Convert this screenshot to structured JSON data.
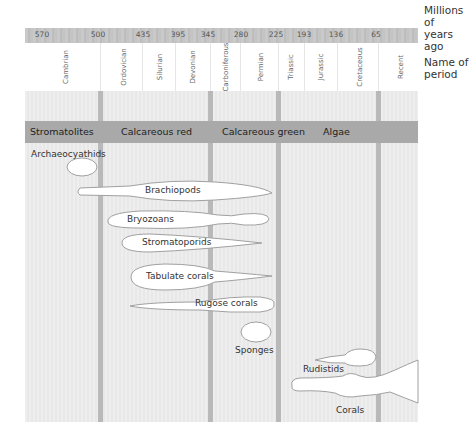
{
  "legend": {
    "time_label": "Millions of years ago",
    "period_label": "Name of period"
  },
  "time_ticks": [
    "570",
    "500",
    "435",
    "395",
    "345",
    "280",
    "225",
    "193",
    "136",
    "65"
  ],
  "periods": [
    "Cambrian",
    "Ordovician",
    "Silurian",
    "Devonian",
    "Carboniferous",
    "Permian",
    "Triassic",
    "Jurassic",
    "Cretaceous",
    "Recent"
  ],
  "reef_builder_groups": [
    "Stromatolites",
    "Calcareous red",
    "Calcareous green",
    "Algae"
  ],
  "taxa": [
    {
      "name": "Archaeocyathids",
      "shape": "oval-cambrian"
    },
    {
      "name": "Brachiopods",
      "shape": "spindle-cambrian-to-permian"
    },
    {
      "name": "Bryozoans",
      "shape": "ordovician-to-permian"
    },
    {
      "name": "Stromatoporids",
      "shape": "ordovician-to-permian"
    },
    {
      "name": "Tabulate corals",
      "shape": "ordovician-to-permian"
    },
    {
      "name": "Rugose corals",
      "shape": "ordovician-to-permian"
    },
    {
      "name": "Sponges",
      "shape": "oval-permian"
    },
    {
      "name": "Rudistids",
      "shape": "jurassic-to-cretaceous"
    },
    {
      "name": "Corals",
      "shape": "triassic-to-recent"
    }
  ],
  "colors": {
    "time_band": "#c4c4c4",
    "group_band": "#a9a9a9",
    "chart_bg": "#ececec",
    "era_divider": "#b9b9b9",
    "shape_fill": "#ffffff",
    "shape_stroke": "#a0a0a0"
  }
}
